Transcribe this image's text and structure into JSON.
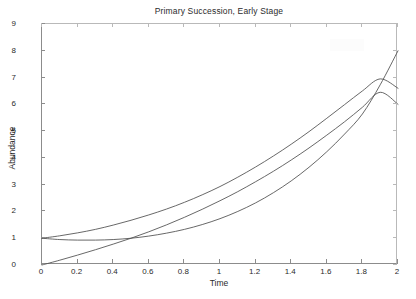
{
  "chart_data": {
    "type": "line",
    "title": "Primary Succession, Early Stage",
    "xlabel": "Time",
    "ylabel": "Abundance",
    "xlim": [
      0,
      2
    ],
    "ylim": [
      0,
      9
    ],
    "grid": false,
    "legend": null,
    "xticks": [
      "0",
      "0.2",
      "0.4",
      "0.6",
      "0.8",
      "1",
      "1.2",
      "1.4",
      "1.6",
      "1.8",
      "2"
    ],
    "xtick_values": [
      0,
      0.2,
      0.4,
      0.6,
      0.8,
      1,
      1.2,
      1.4,
      1.6,
      1.8,
      2
    ],
    "yticks": [
      "0",
      "1",
      "2",
      "3",
      "4",
      "5",
      "6",
      "7",
      "8",
      "9"
    ],
    "ytick_values": [
      0,
      1,
      2,
      3,
      4,
      5,
      6,
      7,
      8,
      9
    ],
    "x": [
      0,
      0.1,
      0.2,
      0.3,
      0.4,
      0.5,
      0.6,
      0.7,
      0.8,
      0.9,
      1.0,
      1.1,
      1.2,
      1.3,
      1.4,
      1.5,
      1.6,
      1.7,
      1.8,
      1.9,
      2.0
    ],
    "series": [
      {
        "name": "upper-curve",
        "values": [
          1.0,
          1.09,
          1.2,
          1.33,
          1.49,
          1.67,
          1.87,
          2.09,
          2.34,
          2.62,
          2.93,
          3.28,
          3.66,
          4.07,
          4.51,
          4.98,
          5.48,
          5.99,
          6.5,
          6.95,
          6.6
        ]
      },
      {
        "name": "middle-curve",
        "values": [
          1.0,
          0.95,
          0.93,
          0.93,
          0.95,
          1.0,
          1.08,
          1.19,
          1.33,
          1.51,
          1.73,
          2.0,
          2.32,
          2.7,
          3.14,
          3.65,
          4.23,
          4.89,
          5.64,
          6.73,
          8.0
        ]
      },
      {
        "name": "lower-curve",
        "values": [
          0.0,
          0.18,
          0.37,
          0.57,
          0.78,
          1.0,
          1.24,
          1.5,
          1.78,
          2.08,
          2.4,
          2.74,
          3.11,
          3.5,
          3.92,
          4.37,
          4.85,
          5.35,
          5.89,
          6.45,
          6.0
        ]
      }
    ],
    "colors": {
      "line": "#4d4d4d",
      "axis": "#8c8c8c",
      "text": "#2b2b2b",
      "background": "#ffffff"
    }
  }
}
